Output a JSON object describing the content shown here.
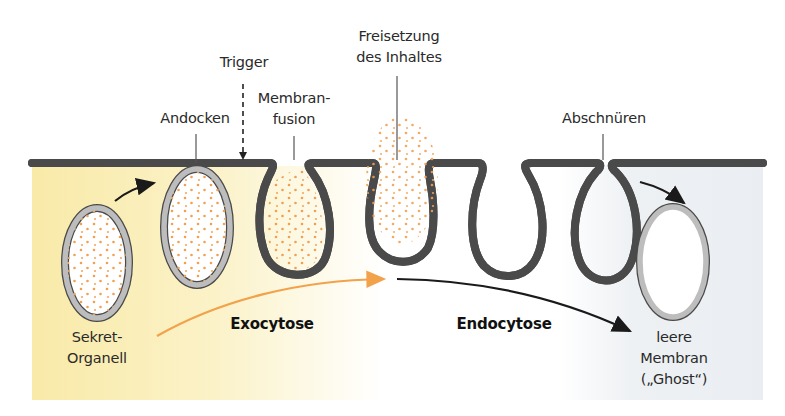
{
  "diagram": {
    "labels": {
      "trigger": "Trigger",
      "andocken": "Andocken",
      "membranfusion_line1": "Membran-",
      "membranfusion_line2": "fusion",
      "freisetzung_line1": "Freisetzung",
      "freisetzung_line2": "des Inhaltes",
      "abschnueren": "Abschnüren",
      "sekret_line1": "Sekret-",
      "sekret_line2": "Organell",
      "exocytose": "Exocytose",
      "endocytose": "Endocytose",
      "ghost_line1": "leere",
      "ghost_line2": "Membran",
      "ghost_line3": "(„Ghost“)"
    },
    "stages": [
      {
        "name": "Sekret-Organell",
        "type": "vesicle-filled"
      },
      {
        "name": "Andocken",
        "type": "vesicle-docked"
      },
      {
        "name": "Membranfusion",
        "type": "fusion-pore"
      },
      {
        "name": "Freisetzung des Inhaltes",
        "type": "open-pit-release"
      },
      {
        "name": "Endocytose pit",
        "type": "open-pit-empty"
      },
      {
        "name": "Abschnüren",
        "type": "pinching-pit"
      },
      {
        "name": "leere Membran (Ghost)",
        "type": "vesicle-empty"
      }
    ],
    "colors": {
      "membrane_fill": "#b9b9b9",
      "membrane_stroke": "#4a4a4a",
      "content_dots": "#f0a050",
      "exocytose_arrow": "#f2a24a",
      "endocytose_arrow": "#1a1a1a",
      "cytoplasm_left": "#faefb8",
      "cytoplasm_right": "#eef1f4"
    }
  }
}
